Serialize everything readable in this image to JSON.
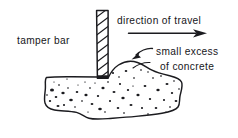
{
  "diagram": {
    "background_color": "#ffffff",
    "ink_color": "#1b1b1f",
    "labels": {
      "tamper_bar": "tamper bar",
      "direction_of_travel": "direction of travel",
      "small_excess_line1": "small excess",
      "small_excess_line2": "of concrete"
    },
    "annotations": {
      "travel_arrow": "arrow pointing right",
      "excess_leader": "curved leader with arrowhead pointing to concrete bump"
    },
    "parts": {
      "tamper_bar_icon": "hatched-vertical-bar",
      "concrete_mass_icon": "speckled-irregular-mass",
      "excess_bump_icon": "rounded-mound"
    }
  }
}
